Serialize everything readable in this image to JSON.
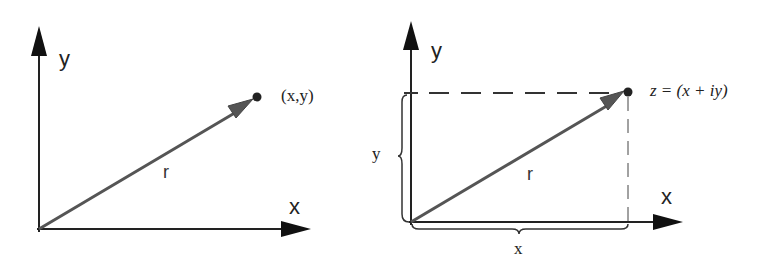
{
  "left_diagram": {
    "y_axis_label": "y",
    "x_axis_label": "x",
    "vector_label": "r",
    "point_label": "(x,y)"
  },
  "right_diagram": {
    "y_axis_label": "y",
    "x_axis_label": "x",
    "vector_label": "r",
    "point_label": "z = (x + iy)",
    "y_component_label": "y",
    "x_component_label": "x"
  },
  "colors": {
    "axis": "#222222",
    "vector": "#555555",
    "dashed": "#333333"
  }
}
